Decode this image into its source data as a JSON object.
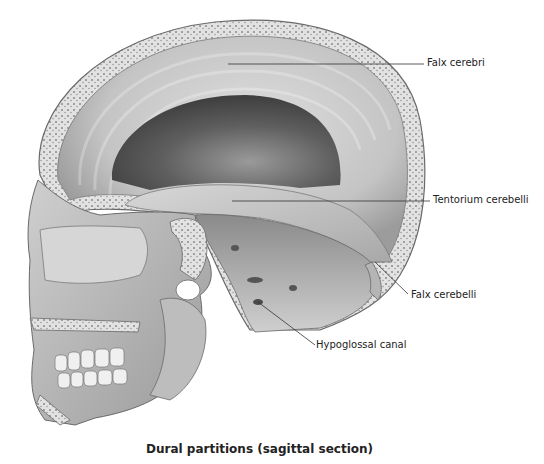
{
  "figure": {
    "title": "Dural partitions (sagittal section)",
    "view": "sagittal section of skull",
    "labels": [
      {
        "id": "falx-cerebri",
        "text": "Falx cerebri"
      },
      {
        "id": "tentorium-cerebelli",
        "text": "Tentorium cerebelli"
      },
      {
        "id": "falx-cerebelli",
        "text": "Falx cerebelli"
      },
      {
        "id": "hypoglossal-canal",
        "text": "Hypoglossal canal"
      }
    ]
  },
  "colors": {
    "bone": "#e4e4e4",
    "bone_edge": "#6a6a6a",
    "dura_light": "#cfcfcf",
    "cavity_dark": "#5a5a5a",
    "leader_line": "#333333",
    "text": "#222222"
  }
}
